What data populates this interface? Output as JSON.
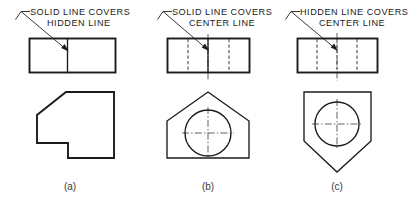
{
  "figure": {
    "background_color": "#ffffff",
    "line_color": "#1b1b1b",
    "hidden_line_color": "#4a4a4a",
    "center_line_color": "#5a5a5a",
    "width": 418,
    "height": 202
  },
  "panels": [
    {
      "id": "a",
      "caption": "(a)",
      "note_line_1": "SOLID LINE COVERS",
      "note_line_2": "HIDDEN LINE",
      "top_view_name": "top-view-rectangle-with-solid-divider",
      "front_view_name": "front-view-notched-chamfered-block",
      "line_types": [
        "solid",
        "hidden"
      ]
    },
    {
      "id": "b",
      "caption": "(b)",
      "note_line_1": "SOLID LINE COVERS",
      "note_line_2": "CENTER LINE",
      "top_view_name": "top-view-rectangle-with-solid-divider-and-hidden-lines",
      "front_view_name": "front-view-house-shape-with-circle",
      "line_types": [
        "solid",
        "hidden",
        "center"
      ]
    },
    {
      "id": "c",
      "caption": "(c)",
      "note_line_1": "HIDDEN LINE COVERS",
      "note_line_2": "CENTER LINE",
      "top_view_name": "top-view-rectangle-with-hidden-divider-and-center-line",
      "front_view_name": "front-view-inverted-house-shape-with-circle",
      "line_types": [
        "solid",
        "hidden",
        "center"
      ]
    }
  ]
}
